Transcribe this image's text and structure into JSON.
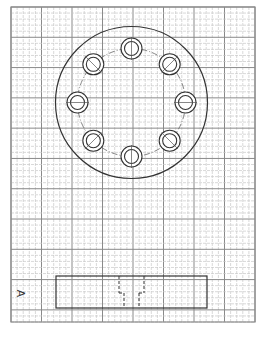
{
  "drawing": {
    "type": "engineering-sketch-on-grid-paper",
    "grid": {
      "x0": 11,
      "y0": 7,
      "x1": 255,
      "y1": 322,
      "minor_spacing": 6.1,
      "major_every": 5,
      "minor_color": "#c8c8c8",
      "major_color": "#8a8a8a",
      "border_color": "#8a8a8a"
    },
    "top_view": {
      "name": "flange-plan-view",
      "center": [
        131.5,
        102.5
      ],
      "outer_radius": 76,
      "bolt_circle_radius": 54,
      "bolt_count": 8,
      "hole_outer_radius": 10.5,
      "hole_inner_radius": 7,
      "line_color": "#333333"
    },
    "section_view": {
      "name": "flange-side-view",
      "rect": {
        "x": 56,
        "y": 276,
        "w": 151,
        "h": 32
      },
      "counterbore": {
        "x1": 119,
        "x2": 144,
        "y_top": 276,
        "y_step": 293
      },
      "hole": {
        "x1": 124,
        "x2": 139,
        "y_step": 293,
        "y_bottom": 308
      },
      "line_color": "#333333"
    },
    "labels": {
      "view_label": "A"
    }
  }
}
